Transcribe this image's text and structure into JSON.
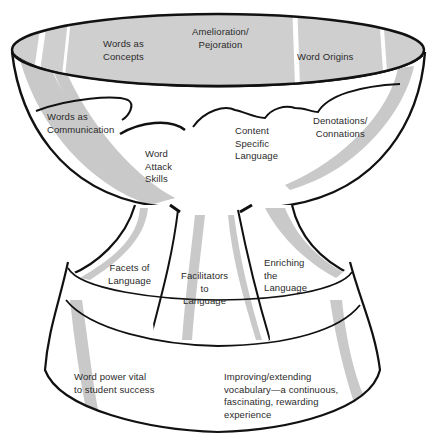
{
  "diagram": {
    "colors": {
      "outline": "#111111",
      "shade": "#c9c9c9",
      "rim_fill": "#cfcfcf",
      "text": "#2a2a2a",
      "background": "#ffffff"
    },
    "rim_labels": {
      "words_as_concepts": "Words as\nConcepts",
      "amelioration_pejoration": "Amelioration/\nPejoration",
      "word_origins": "Word Origins"
    },
    "bowl_labels": {
      "words_as_communication": "Words as\nCommunication",
      "word_attack_skills": "Word\nAttack\nSkills",
      "content_specific_language": "Content\nSpecific\nLanguage",
      "denotations_connations": "Denotations/\nConnations"
    },
    "stem_labels": {
      "facets_of_language": "Facets of\nLanguage",
      "facilitators_to_language": "Facilitators\nto\nLanguage",
      "enriching_the_language": "Enriching\nthe\nLanguage"
    },
    "base_labels": {
      "word_power": "Word power vital\nto student success",
      "improving_extending": "Improving/extending\nvocabulary—a continuous,\nfascinating, rewarding\nexperience"
    }
  }
}
